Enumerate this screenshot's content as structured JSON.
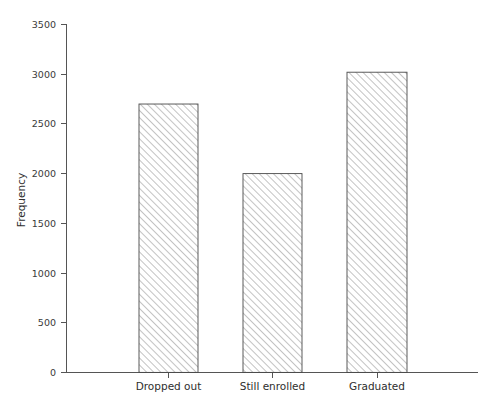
{
  "chart_data": {
    "type": "bar",
    "title": "",
    "subtitle": "",
    "xlabel": "",
    "ylabel": "Frequency",
    "categories": [
      "Dropped out",
      "Still enrolled",
      "Graduated"
    ],
    "values": [
      2700,
      2000,
      3020
    ],
    "series": [
      {
        "name": "Frequency",
        "values": [
          2700,
          2000,
          3020
        ]
      }
    ],
    "ylim": [
      0,
      3500
    ],
    "yticks": [
      0,
      500,
      1000,
      1500,
      2000,
      2500,
      3000,
      3500
    ],
    "ytick_labels": [
      "0",
      "500",
      "1000",
      "1500",
      "2000",
      "2500",
      "3000",
      "3500"
    ],
    "grid": false,
    "legend": null,
    "bar_fill": "hatch-diagonal",
    "bar_fill_color": "#ffffff",
    "bar_edge_color": "#4a4a4a",
    "hatch_color": "#7a7a7a",
    "axis_color": "#555555",
    "background": "#ffffff",
    "annotations": []
  }
}
